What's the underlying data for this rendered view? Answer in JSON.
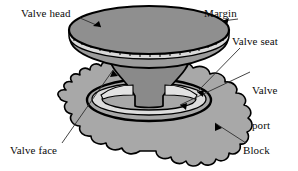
{
  "figure": {
    "type": "technical-line-diagram",
    "background": "#ffffff",
    "line_color": "#000000",
    "colors": {
      "block_fill": "#a8a8a8",
      "head_top_fill": "#8f8f8f",
      "stem_fill": "#8a8a8a",
      "margin_band_fill": "#d8d8d8",
      "seat_fill": "#dcdcdc",
      "outline": "#000000",
      "leader": "#3a3a3a",
      "text": "#0b0b0b"
    },
    "labels": [
      {
        "id": "valve-head",
        "text": "Valve head",
        "lines": [
          "Valve head"
        ]
      },
      {
        "id": "margin",
        "text": "Margin",
        "lines": [
          "Margin"
        ]
      },
      {
        "id": "valve-seat",
        "text": "Valve seat",
        "lines": [
          "Valve seat"
        ]
      },
      {
        "id": "valve-port",
        "text": "Valve port",
        "line1": "Valve",
        "line2": "port"
      },
      {
        "id": "block",
        "text": "Block",
        "lines": [
          "Block"
        ]
      },
      {
        "id": "valve-face",
        "text": "Valve face",
        "lines": [
          "Valve face"
        ]
      }
    ],
    "parts": {
      "valve_head": "mushroom-shaped disc at top of valve",
      "margin": "ticked band around edge of valve head",
      "valve_seat": "angled contact ring in block",
      "valve_port": "opening ellipse below valve seat",
      "valve_face": "tapered underside of valve head",
      "block": "scalloped cast engine block surface"
    }
  }
}
